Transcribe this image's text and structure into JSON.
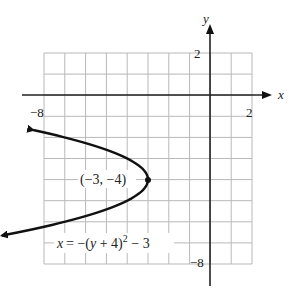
{
  "chart_data": {
    "type": "line",
    "title": "",
    "xlabel": "x",
    "ylabel": "y",
    "xlim": [
      -8,
      2
    ],
    "ylim": [
      -8,
      2
    ],
    "grid": true,
    "tick_labels": {
      "x": [
        {
          "value": -8,
          "label": "−8"
        },
        {
          "value": 2,
          "label": "2"
        }
      ],
      "y": [
        {
          "value": 2,
          "label": "2"
        },
        {
          "value": -8,
          "label": "−8"
        }
      ]
    },
    "series": [
      {
        "name": "x = −(y + 4)² − 3",
        "equation": "x = -(y+4)^2 - 3",
        "orientation": "horizontal-parabola-opening-left",
        "y_range": [
          -6.65,
          -1.65
        ],
        "points": [
          {
            "x": -10.0,
            "y": -1.35
          },
          {
            "x": -6.0,
            "y": -2.27
          },
          {
            "x": -4.0,
            "y": -3.0
          },
          {
            "x": -3.0,
            "y": -4.0
          },
          {
            "x": -4.0,
            "y": -5.0
          },
          {
            "x": -6.0,
            "y": -5.73
          },
          {
            "x": -10.0,
            "y": -6.65
          }
        ],
        "arrows_at_ends": true
      }
    ],
    "annotations": [
      {
        "text": "(−3, −4)",
        "point": {
          "x": -3,
          "y": -4
        },
        "marker": "dot"
      },
      {
        "text": "x = −(y + 4)² − 3",
        "position": "below curve"
      }
    ]
  },
  "labels": {
    "x_axis": "x",
    "y_axis": "y",
    "x_tick_min": "−8",
    "x_tick_max": "2",
    "y_tick_max": "2",
    "y_tick_min": "−8",
    "vertex": "(−3, −4)",
    "equation_main": "x = −(y + 4)",
    "equation_exp": "2",
    "equation_tail": " − 3"
  },
  "colors": {
    "grid": "#b8b8b8",
    "axis": "#222222",
    "curve": "#111111"
  }
}
